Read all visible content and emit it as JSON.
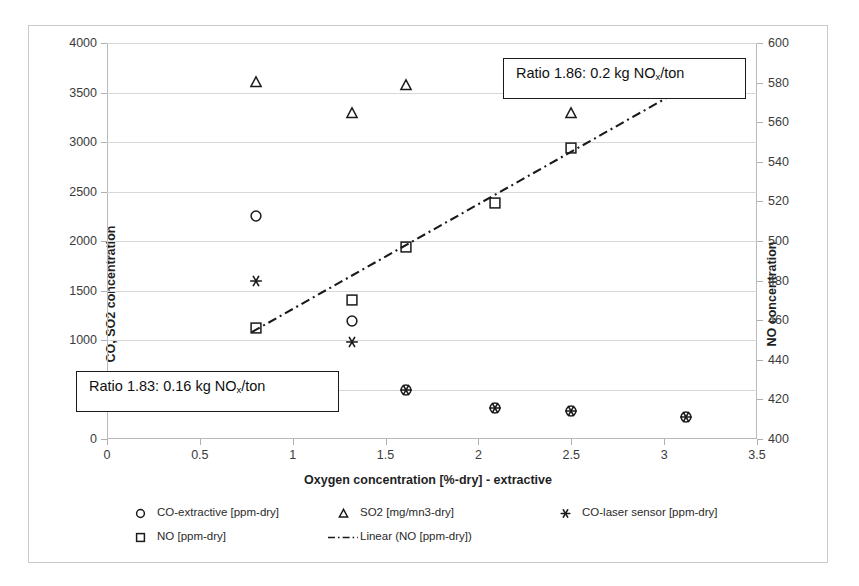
{
  "chart_data": {
    "type": "scatter",
    "title": "",
    "xlabel": "Oxygen concentration [%-dry] - extractive",
    "ylabel": "CO, SO2 concentration",
    "y2label": "NO concentration",
    "xlim": [
      0,
      3.5
    ],
    "ylim": [
      0,
      4000
    ],
    "y2lim": [
      400,
      600
    ],
    "xticks": [
      "0",
      "0.5",
      "1",
      "1.5",
      "2",
      "2.5",
      "3",
      "3.5"
    ],
    "xtick_values": [
      0,
      0.5,
      1,
      1.5,
      2,
      2.5,
      3,
      3.5
    ],
    "yticks": [
      "0",
      "500",
      "1000",
      "1500",
      "2000",
      "2500",
      "3000",
      "3500",
      "4000"
    ],
    "ytick_values": [
      0,
      500,
      1000,
      1500,
      2000,
      2500,
      3000,
      3500,
      4000
    ],
    "y2ticks": [
      "400",
      "420",
      "440",
      "460",
      "480",
      "500",
      "520",
      "540",
      "560",
      "580",
      "600"
    ],
    "y2tick_values": [
      400,
      420,
      440,
      460,
      480,
      500,
      520,
      540,
      560,
      580,
      600
    ],
    "grid": true,
    "legend_position": "bottom",
    "series": [
      {
        "name": "CO-extractive [ppm-dry]",
        "marker": "circle",
        "axis": "left",
        "points": [
          {
            "x": 0.8,
            "y": 2250
          },
          {
            "x": 1.32,
            "y": 1195
          },
          {
            "x": 1.61,
            "y": 500
          },
          {
            "x": 2.09,
            "y": 310
          },
          {
            "x": 2.5,
            "y": 285
          },
          {
            "x": 3.12,
            "y": 225
          }
        ]
      },
      {
        "name": "NO [ppm-dry]",
        "marker": "square",
        "axis": "right",
        "points": [
          {
            "x": 0.8,
            "y": 456
          },
          {
            "x": 1.32,
            "y": 470
          },
          {
            "x": 1.61,
            "y": 497
          },
          {
            "x": 2.09,
            "y": 519
          },
          {
            "x": 2.5,
            "y": 547
          },
          {
            "x": 3.12,
            "y": 578
          }
        ]
      },
      {
        "name": "SO2 [mg/mn3-dry]",
        "marker": "triangle",
        "axis": "left",
        "points": [
          {
            "x": 0.8,
            "y": 3610
          },
          {
            "x": 1.32,
            "y": 3290
          },
          {
            "x": 1.61,
            "y": 3575
          },
          {
            "x": 2.5,
            "y": 3290
          }
        ]
      },
      {
        "name": "CO-laser sensor [ppm-dry]",
        "marker": "asterisk",
        "axis": "left",
        "points": [
          {
            "x": 0.8,
            "y": 1600
          },
          {
            "x": 1.32,
            "y": 980
          },
          {
            "x": 1.61,
            "y": 500
          },
          {
            "x": 2.09,
            "y": 310
          },
          {
            "x": 2.5,
            "y": 285
          },
          {
            "x": 3.12,
            "y": 225
          }
        ]
      }
    ],
    "trendline": {
      "name": "Linear (NO [ppm-dry])",
      "style": "dash-dot",
      "axis": "right",
      "x_start": 0.78,
      "y_start": 454,
      "x_end": 3.14,
      "y_end": 579
    },
    "annotations": [
      {
        "id": "ratio-high",
        "text_before": "Ratio 1.86: 0.2 kg NO",
        "sub": "x",
        "text_after": "/ton",
        "left": 474,
        "top": 32,
        "width": 243,
        "height": 41
      },
      {
        "id": "ratio-low",
        "text_before": "Ratio 1.83: 0.16 kg NO",
        "sub": "x",
        "text_after": "/ton",
        "left": 47,
        "top": 345,
        "width": 263,
        "height": 41
      }
    ],
    "legend_entries": [
      {
        "label": "CO-extractive [ppm-dry]",
        "marker": "circle",
        "col": 0,
        "row": 0
      },
      {
        "label": "SO2 [mg/mn3-dry]",
        "marker": "triangle",
        "col": 1,
        "row": 0
      },
      {
        "label": "CO-laser sensor [ppm-dry]",
        "marker": "asterisk",
        "col": 2,
        "row": 0
      },
      {
        "label": "NO [ppm-dry]",
        "marker": "square",
        "col": 0,
        "row": 1
      },
      {
        "label": "Linear (NO [ppm-dry])",
        "marker": "dash-dot-line",
        "col": 1,
        "row": 1
      }
    ],
    "colors": {
      "marker": "#1a1a1a",
      "grid": "#d7d7d7",
      "axis": "#b9b9b9",
      "text": "#1f1f1f",
      "background": "#ffffff"
    }
  }
}
